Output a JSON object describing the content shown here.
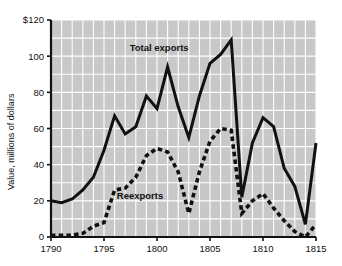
{
  "chart_data": {
    "type": "line",
    "title": "",
    "xlabel": "",
    "ylabel": "Value, millions of dollars",
    "xlim": [
      1790,
      1815
    ],
    "ylim": [
      0,
      120
    ],
    "grid": true,
    "legend_position": "inline-annotations",
    "xticks": [
      1790,
      1795,
      1800,
      1805,
      1810,
      1815
    ],
    "xtick_labels": [
      "1790",
      "1795",
      "1800",
      "1805",
      "1810",
      "1815"
    ],
    "yticks": [
      0,
      20,
      40,
      60,
      80,
      100,
      120
    ],
    "ytick_labels": [
      "0",
      "20",
      "40",
      "60",
      "80",
      "100",
      "$120"
    ],
    "x": [
      1790,
      1791,
      1792,
      1793,
      1794,
      1795,
      1796,
      1797,
      1798,
      1799,
      1800,
      1801,
      1802,
      1803,
      1804,
      1805,
      1806,
      1807,
      1808,
      1809,
      1810,
      1811,
      1812,
      1813,
      1814,
      1815
    ],
    "series": [
      {
        "name": "Total exports",
        "style": "solid",
        "color": "#111111",
        "values": [
          20,
          19,
          21,
          26,
          33,
          48,
          67,
          57,
          61,
          78,
          71,
          94,
          72,
          55,
          78,
          96,
          101,
          109,
          22,
          52,
          66,
          61,
          38,
          28,
          7,
          52
        ]
      },
      {
        "name": "Reexports",
        "style": "dashed",
        "color": "#111111",
        "values": [
          1,
          1,
          1,
          2,
          6,
          8,
          26,
          27,
          33,
          45,
          49,
          47,
          36,
          13,
          36,
          53,
          60,
          59,
          13,
          20,
          24,
          16,
          9,
          3,
          0,
          7
        ]
      }
    ],
    "annotations": [
      {
        "text": "Total exports",
        "x": 1800.2,
        "y": 103
      },
      {
        "text": "Reexports",
        "x": 1798.4,
        "y": 21
      }
    ],
    "colors": {
      "plot_background": "#c8c8c8",
      "gridline": "#ffffff",
      "axis": "#111111",
      "page_background": "#ffffff"
    }
  }
}
